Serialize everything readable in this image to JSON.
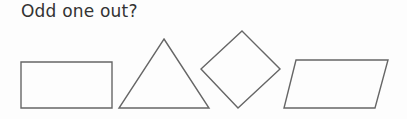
{
  "question": {
    "title": "Odd one out?"
  },
  "colors": {
    "text": "#333333",
    "stroke": "#666666",
    "background": "#fdfdfd"
  },
  "options": [
    {
      "shape": "rectangle",
      "points": "21,62 112,62 112,108 21,108"
    },
    {
      "shape": "triangle",
      "points": "164,39 209,108 119,108"
    },
    {
      "shape": "diamond",
      "points": "242,31 280,69 238,108 201,69"
    },
    {
      "shape": "parallelogram",
      "points": "296,60 388,60 375,108 284,108"
    }
  ]
}
